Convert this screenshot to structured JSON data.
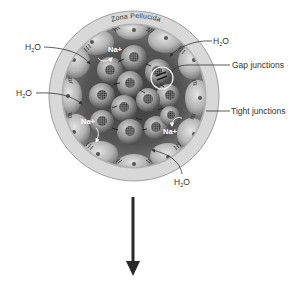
{
  "diagram": {
    "type": "blastocyst-cross-section",
    "zona_label": "Zona Pellucida",
    "labels": {
      "h2o": [
        "H",
        "2",
        "O"
      ],
      "gap_junctions": "Gap junctions",
      "tight_junctions": "Tight junctions",
      "na_plus": "Na+"
    },
    "h2o_labels": [
      {
        "id": "h2o-top-left",
        "text": "H",
        "sub": "2",
        "tail": "O"
      },
      {
        "id": "h2o-mid-left",
        "text": "H",
        "sub": "2",
        "tail": "O"
      },
      {
        "id": "h2o-top-right",
        "text": "H",
        "sub": "2",
        "tail": "O"
      },
      {
        "id": "h2o-bottom",
        "text": "H",
        "sub": "2",
        "tail": "O"
      }
    ],
    "na_labels": [
      {
        "id": "na-top",
        "text": "Na+"
      },
      {
        "id": "na-left",
        "text": "Na+"
      },
      {
        "id": "na-right",
        "text": "Na+"
      }
    ],
    "colors": {
      "zona": "#d6d6d6",
      "zona_edge": "#8a8a8a",
      "inner_bg": "#4a4a4a",
      "cell_light": "#cfcfcf",
      "cell_dark": "#6a6a6a",
      "nucleus": "#5a5a5a",
      "label_text": "#333333",
      "arrow": "#2a2a2a"
    },
    "arrow": {
      "direction": "down"
    }
  }
}
